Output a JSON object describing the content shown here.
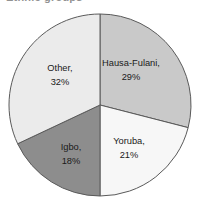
{
  "figure": {
    "cropped_title_fragment": "Ethnic groups"
  },
  "chart_data": {
    "type": "pie",
    "title": "",
    "xlabel": "",
    "ylabel": "",
    "legend_position": "none",
    "grid": false,
    "start_angle_deg": 0,
    "direction": "clockwise",
    "categories": [
      "Hausa-Fulani",
      "Yoruba",
      "Igbo",
      "Other"
    ],
    "values": [
      29,
      21,
      18,
      32
    ],
    "unit": "%",
    "colors": [
      "#c9c9c9",
      "#f7f7f7",
      "#8d8d8d",
      "#ebebeb"
    ],
    "slices": [
      {
        "name": "Hausa-Fulani",
        "value": 29,
        "label_name": "Hausa-Fulani,",
        "label_value": "29%",
        "color": "#c9c9c9",
        "label_x": 131,
        "label_y": 64
      },
      {
        "name": "Yoruba",
        "value": 21,
        "label_name": "Yoruba,",
        "label_value": "21%",
        "color": "#f7f7f7",
        "label_x": 129,
        "label_y": 142
      },
      {
        "name": "Igbo",
        "value": 18,
        "label_name": "Igbo,",
        "label_value": "18%",
        "color": "#8d8d8d",
        "label_x": 71,
        "label_y": 148
      },
      {
        "name": "Other",
        "value": 32,
        "label_name": "Other,",
        "label_value": "32%",
        "color": "#ebebeb",
        "label_x": 60,
        "label_y": 69
      }
    ]
  }
}
